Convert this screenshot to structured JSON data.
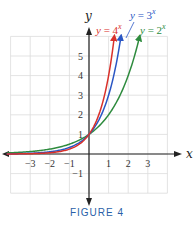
{
  "chart_data": {
    "type": "line",
    "title": "",
    "caption": "FIGURE 4",
    "xlabel": "x",
    "ylabel": "y",
    "xlim": [
      -4,
      4
    ],
    "ylim": [
      -2,
      6
    ],
    "grid": true,
    "x_ticks": [
      -3,
      -2,
      -1,
      1,
      2,
      3
    ],
    "y_ticks": [
      -1,
      1,
      2,
      3,
      4,
      5
    ],
    "series": [
      {
        "name": "y = 2^x",
        "label": "y = 2",
        "exp": "x",
        "base": 2,
        "color": "#2e8b3e",
        "x_end": 2.58
      },
      {
        "name": "y = 3^x",
        "label": "y = 3",
        "exp": "x",
        "base": 3,
        "color": "#2a56c4",
        "x_end": 1.63
      },
      {
        "name": "y = 4^x",
        "label": "y = 4",
        "exp": "x",
        "base": 4,
        "color": "#d9302a",
        "x_end": 1.29
      }
    ],
    "x_start": -4.2
  },
  "labels": {
    "x_axis": "x",
    "y_axis": "y",
    "caption": "FIGURE 4"
  }
}
